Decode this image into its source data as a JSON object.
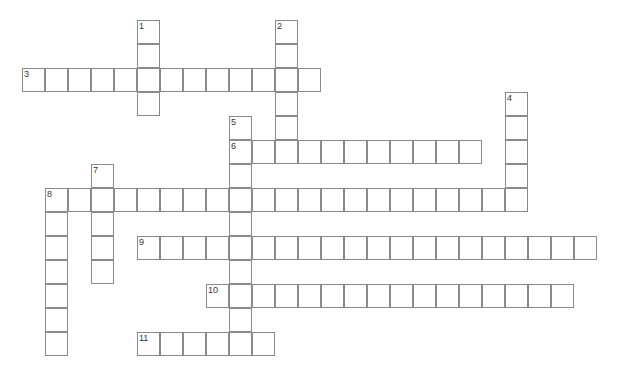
{
  "puzzle": {
    "origin_x": 22,
    "origin_y": 20,
    "cell_w": 23,
    "cell_h": 24,
    "border_color": "#8a8a8a",
    "entries": [
      {
        "number": "1",
        "direction": "down",
        "col": 5,
        "row": 0,
        "length": 4
      },
      {
        "number": "2",
        "direction": "down",
        "col": 11,
        "row": 0,
        "length": 6
      },
      {
        "number": "3",
        "direction": "across",
        "col": 0,
        "row": 2,
        "length": 13
      },
      {
        "number": "4",
        "direction": "down",
        "col": 21,
        "row": 3,
        "length": 5
      },
      {
        "number": "5",
        "direction": "down",
        "col": 9,
        "row": 4,
        "length": 10
      },
      {
        "number": "6",
        "direction": "across",
        "col": 9,
        "row": 5,
        "length": 11
      },
      {
        "number": "7",
        "direction": "down",
        "col": 3,
        "row": 6,
        "length": 5
      },
      {
        "number": "8",
        "direction": "across",
        "col": 1,
        "row": 7,
        "length": 21
      },
      {
        "number": "8",
        "direction": "down",
        "col": 1,
        "row": 7,
        "length": 7
      },
      {
        "number": "9",
        "direction": "across",
        "col": 5,
        "row": 9,
        "length": 20
      },
      {
        "number": "10",
        "direction": "across",
        "col": 8,
        "row": 11,
        "length": 16
      },
      {
        "number": "11",
        "direction": "across",
        "col": 5,
        "row": 13,
        "length": 6
      }
    ]
  }
}
